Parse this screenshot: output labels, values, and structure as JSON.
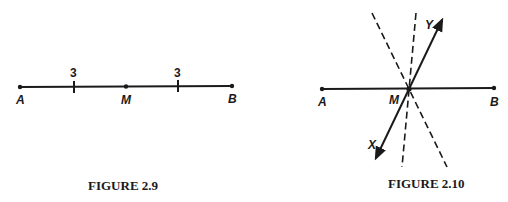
{
  "figures": [
    {
      "caption": "FIGURE 2.9",
      "points": {
        "A": "A",
        "M": "M",
        "B": "B"
      },
      "segment_labels": [
        "3",
        "3"
      ]
    },
    {
      "caption": "FIGURE 2.10",
      "points": {
        "A": "A",
        "M": "M",
        "B": "B",
        "X": "X",
        "Y": "Y"
      }
    }
  ],
  "colors": {
    "ink": "#1a1a1a",
    "background": "#ffffff"
  }
}
